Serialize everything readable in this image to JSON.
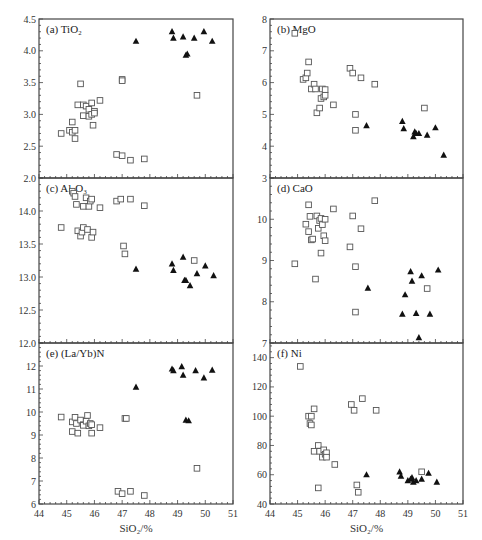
{
  "figure": {
    "xlabel": "SiO₂/%",
    "xlim": [
      44,
      51
    ],
    "xticks": [
      44,
      45,
      46,
      47,
      48,
      49,
      50,
      51
    ],
    "legend": {
      "open_square": "group A (open squares)",
      "filled_triangle": "group B (filled triangles)"
    }
  },
  "chart_data": [
    {
      "type": "scatter",
      "id": "a",
      "title": "(a) TiO₂",
      "xlabel": "SiO₂/%",
      "ylabel": "",
      "xlim": [
        44,
        51
      ],
      "ylim": [
        2.0,
        4.5
      ],
      "yticks": [
        "2.0",
        "2.5",
        "3.0",
        "3.5",
        "4.0",
        "4.5"
      ],
      "series": [
        {
          "name": "squares",
          "marker": "open-square",
          "points": [
            [
              44.8,
              2.7
            ],
            [
              45.1,
              2.75
            ],
            [
              45.2,
              2.72
            ],
            [
              45.2,
              2.88
            ],
            [
              45.3,
              2.62
            ],
            [
              45.3,
              2.75
            ],
            [
              45.4,
              3.15
            ],
            [
              45.5,
              3.48
            ],
            [
              45.6,
              3.15
            ],
            [
              45.6,
              2.98
            ],
            [
              45.7,
              3.13
            ],
            [
              45.8,
              3.08
            ],
            [
              45.8,
              2.97
            ],
            [
              45.9,
              3.18
            ],
            [
              45.9,
              3.0
            ],
            [
              46.0,
              3.05
            ],
            [
              46.0,
              3.02
            ],
            [
              45.95,
              2.83
            ],
            [
              46.2,
              3.22
            ],
            [
              47.0,
              3.55
            ],
            [
              47.0,
              3.53
            ],
            [
              46.8,
              2.37
            ],
            [
              47.0,
              2.35
            ],
            [
              47.3,
              2.28
            ],
            [
              47.8,
              2.3
            ],
            [
              49.7,
              3.3
            ]
          ]
        },
        {
          "name": "triangles",
          "marker": "filled-triangle",
          "points": [
            [
              47.5,
              4.15
            ],
            [
              48.8,
              4.3
            ],
            [
              48.85,
              4.2
            ],
            [
              49.2,
              4.22
            ],
            [
              49.3,
              3.93
            ],
            [
              49.35,
              3.95
            ],
            [
              49.6,
              4.2
            ],
            [
              49.95,
              4.3
            ],
            [
              50.25,
              4.15
            ]
          ]
        }
      ]
    },
    {
      "type": "scatter",
      "id": "b",
      "title": "(b) MgO",
      "xlabel": "SiO₂/%",
      "ylabel": "",
      "xlim": [
        44,
        51
      ],
      "ylim": [
        3,
        8
      ],
      "yticks": [
        "3",
        "4",
        "5",
        "6",
        "7",
        "8"
      ],
      "series": [
        {
          "name": "squares",
          "marker": "open-square",
          "points": [
            [
              44.9,
              7.55
            ],
            [
              45.2,
              6.1
            ],
            [
              45.3,
              6.15
            ],
            [
              45.35,
              6.3
            ],
            [
              45.4,
              6.65
            ],
            [
              45.5,
              5.8
            ],
            [
              45.6,
              5.95
            ],
            [
              45.65,
              5.8
            ],
            [
              45.7,
              5.05
            ],
            [
              45.8,
              5.2
            ],
            [
              45.85,
              5.5
            ],
            [
              45.9,
              5.8
            ],
            [
              45.95,
              5.55
            ],
            [
              46.0,
              5.6
            ],
            [
              46.0,
              5.78
            ],
            [
              46.3,
              5.3
            ],
            [
              46.9,
              6.45
            ],
            [
              47.0,
              6.3
            ],
            [
              47.1,
              5.0
            ],
            [
              47.1,
              4.5
            ],
            [
              47.3,
              6.15
            ],
            [
              47.8,
              5.95
            ],
            [
              49.6,
              5.2
            ]
          ]
        },
        {
          "name": "triangles",
          "marker": "filled-triangle",
          "points": [
            [
              47.5,
              4.65
            ],
            [
              48.8,
              4.78
            ],
            [
              48.85,
              4.55
            ],
            [
              49.2,
              4.3
            ],
            [
              49.25,
              4.45
            ],
            [
              49.3,
              4.4
            ],
            [
              49.4,
              4.4
            ],
            [
              49.7,
              4.35
            ],
            [
              50.0,
              4.58
            ],
            [
              50.3,
              3.72
            ]
          ]
        }
      ]
    },
    {
      "type": "scatter",
      "id": "c",
      "title": "(c) Al₂O₃",
      "xlabel": "SiO₂/%",
      "ylabel": "",
      "xlim": [
        44,
        51
      ],
      "ylim": [
        12.0,
        14.5
      ],
      "yticks": [
        "12.0",
        "12.5",
        "13.0",
        "13.5",
        "14.0"
      ],
      "series": [
        {
          "name": "squares",
          "marker": "open-square",
          "points": [
            [
              44.8,
              13.75
            ],
            [
              45.2,
              14.3
            ],
            [
              45.25,
              14.27
            ],
            [
              45.3,
              14.22
            ],
            [
              45.35,
              14.1
            ],
            [
              45.4,
              13.7
            ],
            [
              45.5,
              13.62
            ],
            [
              45.55,
              13.68
            ],
            [
              45.6,
              13.75
            ],
            [
              45.6,
              14.07
            ],
            [
              45.7,
              14.2
            ],
            [
              45.75,
              13.72
            ],
            [
              45.8,
              14.07
            ],
            [
              45.85,
              14.15
            ],
            [
              45.9,
              14.18
            ],
            [
              45.9,
              13.6
            ],
            [
              45.95,
              13.68
            ],
            [
              46.2,
              14.05
            ],
            [
              46.8,
              14.15
            ],
            [
              46.95,
              14.18
            ],
            [
              47.05,
              13.47
            ],
            [
              47.1,
              13.35
            ],
            [
              47.3,
              14.18
            ],
            [
              47.8,
              14.08
            ],
            [
              49.6,
              13.25
            ]
          ]
        },
        {
          "name": "triangles",
          "marker": "filled-triangle",
          "points": [
            [
              47.5,
              13.12
            ],
            [
              48.8,
              13.2
            ],
            [
              48.85,
              13.1
            ],
            [
              49.2,
              13.3
            ],
            [
              49.25,
              12.95
            ],
            [
              49.3,
              12.95
            ],
            [
              49.45,
              12.87
            ],
            [
              49.7,
              13.05
            ],
            [
              50.0,
              13.17
            ],
            [
              50.3,
              13.02
            ]
          ]
        }
      ]
    },
    {
      "type": "scatter",
      "id": "d",
      "title": "(d) CaO",
      "xlabel": "SiO₂/%",
      "ylabel": "",
      "xlim": [
        44,
        51
      ],
      "ylim": [
        7,
        11
      ],
      "yticks": [
        "7",
        "8",
        "9",
        "10"
      ],
      "series": [
        {
          "name": "squares",
          "marker": "open-square",
          "points": [
            [
              44.9,
              8.92
            ],
            [
              45.3,
              9.88
            ],
            [
              45.4,
              10.35
            ],
            [
              45.4,
              9.7
            ],
            [
              45.45,
              10.07
            ],
            [
              45.5,
              9.5
            ],
            [
              45.55,
              9.52
            ],
            [
              45.65,
              8.55
            ],
            [
              45.7,
              10.08
            ],
            [
              45.75,
              9.78
            ],
            [
              45.8,
              9.97
            ],
            [
              45.85,
              10.02
            ],
            [
              45.85,
              9.18
            ],
            [
              45.9,
              9.87
            ],
            [
              45.95,
              9.6
            ],
            [
              46.0,
              9.48
            ],
            [
              46.0,
              10.0
            ],
            [
              46.3,
              10.25
            ],
            [
              46.9,
              9.33
            ],
            [
              47.0,
              10.08
            ],
            [
              47.1,
              8.85
            ],
            [
              47.1,
              7.75
            ],
            [
              47.3,
              9.77
            ],
            [
              47.8,
              10.45
            ],
            [
              49.7,
              8.32
            ]
          ]
        },
        {
          "name": "triangles",
          "marker": "filled-triangle",
          "points": [
            [
              47.55,
              8.33
            ],
            [
              48.8,
              7.7
            ],
            [
              48.9,
              8.17
            ],
            [
              49.1,
              8.73
            ],
            [
              49.15,
              8.5
            ],
            [
              49.3,
              7.72
            ],
            [
              49.4,
              7.13
            ],
            [
              49.5,
              8.63
            ],
            [
              49.8,
              7.7
            ],
            [
              50.1,
              8.77
            ]
          ]
        }
      ]
    },
    {
      "type": "scatter",
      "id": "e",
      "title": "(e) (La/Yb)N",
      "xlabel": "SiO₂/%",
      "ylabel": "",
      "xlim": [
        44,
        51
      ],
      "ylim": [
        6,
        13
      ],
      "yticks": [
        "6",
        "7",
        "8",
        "9",
        "10",
        "11",
        "12"
      ],
      "series": [
        {
          "name": "squares",
          "marker": "open-square",
          "points": [
            [
              44.8,
              9.78
            ],
            [
              45.2,
              9.57
            ],
            [
              45.2,
              9.15
            ],
            [
              45.3,
              9.77
            ],
            [
              45.35,
              9.5
            ],
            [
              45.4,
              9.08
            ],
            [
              45.5,
              9.65
            ],
            [
              45.6,
              9.45
            ],
            [
              45.6,
              9.42
            ],
            [
              45.7,
              9.6
            ],
            [
              45.75,
              9.85
            ],
            [
              45.8,
              9.4
            ],
            [
              45.85,
              9.5
            ],
            [
              45.9,
              9.08
            ],
            [
              45.9,
              9.45
            ],
            [
              46.2,
              9.32
            ],
            [
              47.1,
              9.72
            ],
            [
              47.15,
              9.72
            ],
            [
              46.85,
              6.55
            ],
            [
              47.0,
              6.45
            ],
            [
              47.3,
              6.55
            ],
            [
              47.8,
              6.37
            ],
            [
              49.7,
              7.55
            ]
          ]
        },
        {
          "name": "triangles",
          "marker": "filled-triangle",
          "points": [
            [
              47.5,
              11.08
            ],
            [
              48.8,
              11.87
            ],
            [
              48.85,
              11.8
            ],
            [
              49.15,
              11.97
            ],
            [
              49.2,
              11.6
            ],
            [
              49.3,
              9.65
            ],
            [
              49.4,
              9.62
            ],
            [
              49.65,
              11.8
            ],
            [
              49.95,
              11.48
            ],
            [
              50.25,
              11.82
            ]
          ]
        }
      ]
    },
    {
      "type": "scatter",
      "id": "f",
      "title": "(f) Ni",
      "xlabel": "SiO₂/%",
      "ylabel": "",
      "xlim": [
        44,
        51
      ],
      "ylim": [
        40,
        150
      ],
      "yticks": [
        "40",
        "60",
        "80",
        "100",
        "120",
        "140"
      ],
      "series": [
        {
          "name": "squares",
          "marker": "open-square",
          "points": [
            [
              45.1,
              134
            ],
            [
              45.4,
              100
            ],
            [
              45.45,
              95
            ],
            [
              45.5,
              94
            ],
            [
              45.5,
              100
            ],
            [
              45.6,
              105
            ],
            [
              45.6,
              76
            ],
            [
              45.75,
              80
            ],
            [
              45.75,
              51
            ],
            [
              45.8,
              76
            ],
            [
              45.9,
              72
            ],
            [
              45.95,
              77
            ],
            [
              46.0,
              74
            ],
            [
              46.05,
              75
            ],
            [
              46.05,
              72
            ],
            [
              46.35,
              67
            ],
            [
              46.95,
              108
            ],
            [
              47.05,
              104
            ],
            [
              47.35,
              112
            ],
            [
              47.15,
              53
            ],
            [
              47.2,
              48
            ],
            [
              47.85,
              104
            ],
            [
              49.5,
              62
            ]
          ]
        },
        {
          "name": "triangles",
          "marker": "filled-triangle",
          "points": [
            [
              47.5,
              60
            ],
            [
              48.7,
              62
            ],
            [
              48.75,
              59
            ],
            [
              49.0,
              56
            ],
            [
              49.1,
              57
            ],
            [
              49.15,
              58
            ],
            [
              49.2,
              55
            ],
            [
              49.3,
              56
            ],
            [
              49.5,
              57
            ],
            [
              49.75,
              61
            ],
            [
              50.05,
              55
            ]
          ]
        }
      ]
    }
  ]
}
